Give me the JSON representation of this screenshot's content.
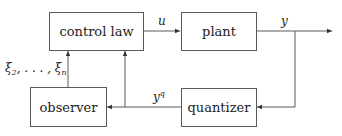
{
  "diagram": {
    "type": "block-diagram",
    "blocks": {
      "control_law": "control law",
      "plant": "plant",
      "observer": "observer",
      "quantizer": "quantizer"
    },
    "signals": {
      "u": "u",
      "y": "y",
      "yq_base": "y",
      "yq_sup": "q",
      "xi_text": "ξ",
      "xi_sub_start": "2",
      "xi_mid": ", . . . , ξ",
      "xi_sub_end": "n"
    },
    "edges": [
      {
        "from": "control law",
        "to": "plant",
        "label": "u"
      },
      {
        "from": "plant",
        "to": "output",
        "label": "y"
      },
      {
        "from": "plant output y",
        "to": "quantizer"
      },
      {
        "from": "quantizer",
        "to": "observer",
        "label": "y^q"
      },
      {
        "from": "quantizer output y^q",
        "to": "control law"
      },
      {
        "from": "observer",
        "to": "control law",
        "label": "ξ_2, ..., ξ_n"
      }
    ],
    "colors": {
      "line": "#5a5a5a",
      "text": "#222222",
      "background": "#ffffff"
    }
  }
}
